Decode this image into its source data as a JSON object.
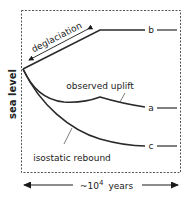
{
  "diagram": {
    "y_axis_label": "sea level",
    "x_axis_label": {
      "prefix": "~10",
      "exponent": "4",
      "suffix": "years"
    },
    "phase_label": "deglaciation",
    "curves": [
      {
        "id": "a",
        "label": "a",
        "description": "observed uplift"
      },
      {
        "id": "b",
        "label": "b",
        "description": "eustatic sea level"
      },
      {
        "id": "c",
        "label": "c",
        "description": "isostatic rebound"
      }
    ],
    "annotations": {
      "observed_uplift": "observed uplift",
      "isostatic_rebound": "isostatic rebound"
    },
    "colors": {
      "line": "#2a2a2a",
      "frame": "#555555",
      "background": "#ffffff"
    }
  }
}
